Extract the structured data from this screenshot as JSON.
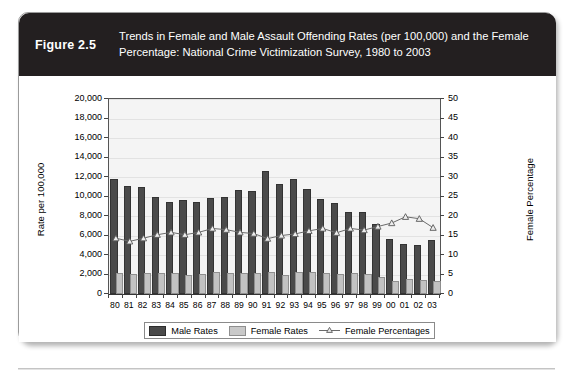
{
  "figure": {
    "number_label": "Figure 2.5",
    "caption_line1": "Trends in Female and Male Assault Offending Rates (per 100,000) and the Female",
    "caption_line2": "Percentage: National Crime Victimization Survey, 1980 to 2003"
  },
  "colors": {
    "header_background": "#231f20",
    "header_text": "#ffffff",
    "male_bar": "#4a4a4a",
    "female_bar": "#c2c2c2",
    "line": "#6b6b6b",
    "plot_background": "#f4f4f4",
    "card_border": "#9b9b9b"
  },
  "chart_data": {
    "type": "bar",
    "title": "Trends in Female and Male Assault Offending Rates (per 100,000) and the Female Percentage: National Crime Victimization Survey, 1980 to 2003",
    "xlabel": "",
    "ylabel": "Rate per 100,000",
    "y2label": "Female Percentage",
    "ylim": [
      0,
      20000
    ],
    "y2lim": [
      0,
      50
    ],
    "yticks": [
      "0",
      "2,000",
      "4,000",
      "6,000",
      "8,000",
      "10,000",
      "12,000",
      "14,000",
      "16,000",
      "18,000",
      "20,000"
    ],
    "ytick_values": [
      0,
      2000,
      4000,
      6000,
      8000,
      10000,
      12000,
      14000,
      16000,
      18000,
      20000
    ],
    "y2ticks": [
      "0",
      "5",
      "10",
      "15",
      "20",
      "25",
      "30",
      "35",
      "40",
      "45",
      "50"
    ],
    "y2tick_values": [
      0,
      5,
      10,
      15,
      20,
      25,
      30,
      35,
      40,
      45,
      50
    ],
    "grid": true,
    "legend_position": "bottom",
    "categories": [
      "80",
      "81",
      "82",
      "83",
      "84",
      "85",
      "86",
      "87",
      "88",
      "89",
      "90",
      "91",
      "92",
      "93",
      "94",
      "95",
      "96",
      "97",
      "98",
      "99",
      "00",
      "01",
      "02",
      "03"
    ],
    "series": [
      {
        "name": "Male Rates",
        "axis": "left",
        "kind": "bar",
        "values": [
          11600,
          10900,
          10800,
          9700,
          9200,
          9400,
          9200,
          9600,
          9700,
          10500,
          10400,
          12400,
          11100,
          11600,
          10600,
          9500,
          9100,
          8200,
          8200,
          7000,
          5400,
          4900,
          4800,
          5300
        ]
      },
      {
        "name": "Female Rates",
        "axis": "left",
        "kind": "bar",
        "values": [
          1950,
          1800,
          1950,
          2000,
          1900,
          1750,
          1800,
          2100,
          2000,
          1950,
          1900,
          2100,
          1700,
          2050,
          2100,
          1950,
          1800,
          1900,
          1800,
          1500,
          1150,
          1300,
          1250,
          1150
        ]
      },
      {
        "name": "Female Percentages",
        "axis": "right",
        "kind": "line",
        "values": [
          14.3,
          13.5,
          14.3,
          15.2,
          15.8,
          15.2,
          15.8,
          16.8,
          16.5,
          15.8,
          15.5,
          14.2,
          15.0,
          15.4,
          16.2,
          16.8,
          15.7,
          16.8,
          16.4,
          17.3,
          18.2,
          19.8,
          19.3,
          17.0
        ]
      }
    ]
  },
  "legend": {
    "items": [
      {
        "label": "Male Rates",
        "marker": "male-swatch"
      },
      {
        "label": "Female Rates",
        "marker": "female-swatch"
      },
      {
        "label": "Female Percentages",
        "marker": "line-triangle-marker"
      }
    ]
  }
}
